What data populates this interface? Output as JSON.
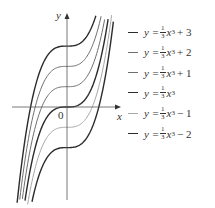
{
  "chart_data": {
    "type": "line",
    "title": "",
    "xlabel": "x",
    "ylabel": "y",
    "origin_label": "0",
    "grid": false,
    "legend_position": "right",
    "x_range": [
      -3.1,
      3.1
    ],
    "y_range": [
      -5,
      5
    ],
    "series": [
      {
        "name": "y = 1/3 x^3 + 3",
        "shift": 3,
        "color": "#2b2b2b",
        "width": 1.4
      },
      {
        "name": "y = 1/3 x^3 + 2",
        "shift": 2,
        "color": "#6e6e6e",
        "width": 1.0
      },
      {
        "name": "y = 1/3 x^3 + 1",
        "shift": 1,
        "color": "#6e6e6e",
        "width": 1.0
      },
      {
        "name": "y = 1/3 x^3",
        "shift": 0,
        "color": "#2b2b2b",
        "width": 1.4
      },
      {
        "name": "y = 1/3 x^3 - 1",
        "shift": -1,
        "color": "#a8a8a8",
        "width": 1.0
      },
      {
        "name": "y = 1/3 x^3 - 2",
        "shift": -2,
        "color": "#2b2b2b",
        "width": 1.4
      }
    ]
  },
  "axes": {
    "x_label": "x",
    "y_label": "y",
    "origin": "0"
  },
  "legend": [
    {
      "prefix": "y =",
      "num": "1",
      "den": "3",
      "var": "x",
      "exp": "3",
      "rest": "+ 3",
      "color": "#2b2b2b"
    },
    {
      "prefix": "y =",
      "num": "1",
      "den": "3",
      "var": "x",
      "exp": "3",
      "rest": "+ 2",
      "color": "#6e6e6e"
    },
    {
      "prefix": "y =",
      "num": "1",
      "den": "3",
      "var": "x",
      "exp": "3",
      "rest": "+ 1",
      "color": "#6e6e6e"
    },
    {
      "prefix": "y =",
      "num": "1",
      "den": "3",
      "var": "x",
      "exp": "3",
      "rest": "",
      "color": "#2b2b2b"
    },
    {
      "prefix": "y =",
      "num": "1",
      "den": "3",
      "var": "x",
      "exp": "3",
      "rest": "− 1",
      "color": "#a8a8a8"
    },
    {
      "prefix": "y =",
      "num": "1",
      "den": "3",
      "var": "x",
      "exp": "3",
      "rest": "− 2",
      "color": "#2b2b2b"
    }
  ]
}
